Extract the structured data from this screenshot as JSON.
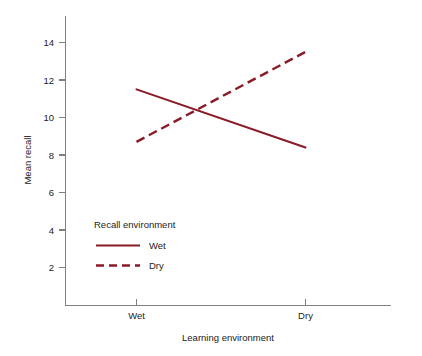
{
  "chart_data": {
    "type": "line",
    "title": "",
    "subtitle": "",
    "xlabel": "Learning environment",
    "ylabel": "Mean recall",
    "categories": [
      "Wet",
      "Dry"
    ],
    "x_tick_labels": [
      "Wet",
      "Dry"
    ],
    "y_tick_labels": [
      "2",
      "4",
      "6",
      "8",
      "10",
      "12",
      "14"
    ],
    "y_ticks": [
      2,
      4,
      6,
      8,
      10,
      12,
      14
    ],
    "ylim": [
      0,
      15
    ],
    "grid": false,
    "legend_title": "Recall environment",
    "legend_position": "inside-lower-left",
    "series": [
      {
        "name": "Wet",
        "style": "solid",
        "color": "#8B1A27",
        "values": [
          11.5,
          8.4
        ]
      },
      {
        "name": "Dry",
        "style": "dashed",
        "color": "#8B1A27",
        "values": [
          8.7,
          13.5
        ]
      }
    ]
  },
  "axes": {
    "y_title": "Mean recall",
    "x_title": "Learning environment",
    "y_tick_2": "2",
    "y_tick_4": "4",
    "y_tick_6": "6",
    "y_tick_8": "8",
    "y_tick_10": "10",
    "y_tick_12": "12",
    "y_tick_14": "14",
    "x_tick_wet": "Wet",
    "x_tick_dry": "Dry"
  },
  "legend": {
    "title": "Recall environment",
    "entry_solid_label": "Wet",
    "entry_dashed_label": "Dry"
  },
  "colors": {
    "series": "#8B1A27",
    "axis": "#808080",
    "text": "#222222",
    "background": "#ffffff"
  }
}
